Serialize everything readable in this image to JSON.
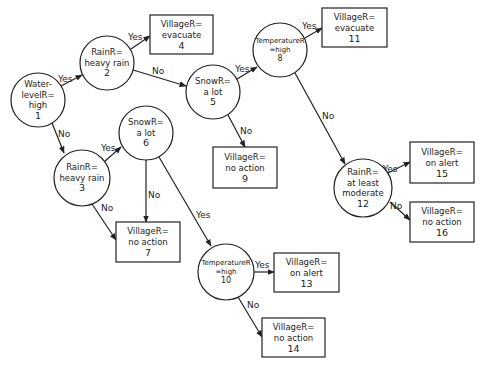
{
  "diagram": {
    "type": "decision-tree",
    "colors": {
      "stroke": "#222222",
      "background": "#ffffff"
    },
    "decision_nodes": [
      {
        "id": "1",
        "lines": [
          "Water-",
          "levelR=",
          "high",
          "1"
        ],
        "cx": 38,
        "cy": 100,
        "r": 27
      },
      {
        "id": "2",
        "lines": [
          "RainR=",
          "heavy rain",
          "2"
        ],
        "cx": 107,
        "cy": 63,
        "r": 27
      },
      {
        "id": "3",
        "lines": [
          "RainR=",
          "heavy rain",
          "3"
        ],
        "cx": 82,
        "cy": 178,
        "r": 28
      },
      {
        "id": "5",
        "lines": [
          "SnowR=",
          "a lot",
          "5"
        ],
        "cx": 213,
        "cy": 92,
        "r": 27
      },
      {
        "id": "6",
        "lines": [
          "SnowR=",
          "a lot",
          "6"
        ],
        "cx": 146,
        "cy": 133,
        "r": 27
      },
      {
        "id": "8",
        "lines": [
          "TemperatureR",
          "=high",
          "8"
        ],
        "cx": 280,
        "cy": 50,
        "r": 27
      },
      {
        "id": "10",
        "lines": [
          "TemperatureR",
          "=high",
          "10"
        ],
        "cx": 226,
        "cy": 272,
        "r": 28
      },
      {
        "id": "12",
        "lines": [
          "RainR=",
          "at least",
          "moderate",
          "12"
        ],
        "cx": 363,
        "cy": 188,
        "r": 29
      }
    ],
    "leaf_nodes": [
      {
        "id": "4",
        "lines": [
          "VillageR=",
          "evacuate",
          "4"
        ],
        "x": 150,
        "y": 15,
        "w": 63,
        "h": 39
      },
      {
        "id": "7",
        "lines": [
          "VillageR=",
          "no action",
          "7"
        ],
        "x": 116,
        "y": 222,
        "w": 64,
        "h": 40
      },
      {
        "id": "9",
        "lines": [
          "VillageR=",
          "no action",
          "9"
        ],
        "x": 213,
        "y": 147,
        "w": 64,
        "h": 41
      },
      {
        "id": "11",
        "lines": [
          "VillageR=",
          "evacuate",
          "11"
        ],
        "x": 322,
        "y": 8,
        "w": 65,
        "h": 39
      },
      {
        "id": "13",
        "lines": [
          "VillageR=",
          "on alert",
          "13"
        ],
        "x": 274,
        "y": 253,
        "w": 65,
        "h": 39
      },
      {
        "id": "14",
        "lines": [
          "VillageR=",
          "no action",
          "14"
        ],
        "x": 262,
        "y": 318,
        "w": 63,
        "h": 39
      },
      {
        "id": "15",
        "lines": [
          "VillageR=",
          "on alert",
          "15"
        ],
        "x": 410,
        "y": 142,
        "w": 64,
        "h": 41
      },
      {
        "id": "16",
        "lines": [
          "VillageR=",
          "no action",
          "16"
        ],
        "x": 410,
        "y": 202,
        "w": 64,
        "h": 40
      }
    ],
    "edges": [
      {
        "from": "1",
        "to": "2",
        "label": "Yes",
        "x1": 61,
        "y1": 86,
        "x2": 82,
        "y2": 75,
        "lx": 58,
        "ly": 82
      },
      {
        "from": "1",
        "to": "3",
        "label": "No",
        "x1": 52,
        "y1": 123,
        "x2": 64,
        "y2": 153,
        "lx": 58,
        "ly": 137
      },
      {
        "from": "2",
        "to": "4",
        "label": "Yes",
        "x1": 131,
        "y1": 49,
        "x2": 150,
        "y2": 36,
        "lx": 128,
        "ly": 40
      },
      {
        "from": "2",
        "to": "5",
        "label": "No",
        "x1": 133,
        "y1": 70,
        "x2": 186,
        "y2": 86,
        "lx": 152,
        "ly": 74
      },
      {
        "from": "3",
        "to": "6",
        "label": "Yes",
        "x1": 104,
        "y1": 162,
        "x2": 121,
        "y2": 147,
        "lx": 101,
        "ly": 151
      },
      {
        "from": "3",
        "to": "7",
        "label": "No",
        "x1": 92,
        "y1": 204,
        "x2": 116,
        "y2": 240,
        "lx": 101,
        "ly": 211
      },
      {
        "from": "5",
        "to": "8",
        "label": "Yes",
        "x1": 237,
        "y1": 79,
        "x2": 257,
        "y2": 67,
        "lx": 235,
        "ly": 72
      },
      {
        "from": "5",
        "to": "9",
        "label": "No",
        "x1": 228,
        "y1": 115,
        "x2": 245,
        "y2": 147,
        "lx": 240,
        "ly": 134
      },
      {
        "from": "6",
        "to": "7",
        "label": "No",
        "x1": 146,
        "y1": 160,
        "x2": 146,
        "y2": 222,
        "lx": 148,
        "ly": 198
      },
      {
        "from": "6",
        "to": "10",
        "label": "Yes",
        "x1": 159,
        "y1": 157,
        "x2": 211,
        "y2": 246,
        "lx": 196,
        "ly": 218
      },
      {
        "from": "8",
        "to": "11",
        "label": "Yes",
        "x1": 305,
        "y1": 38,
        "x2": 322,
        "y2": 28,
        "lx": 302,
        "ly": 29
      },
      {
        "from": "8",
        "to": "12",
        "label": "No",
        "x1": 295,
        "y1": 73,
        "x2": 345,
        "y2": 164,
        "lx": 322,
        "ly": 119
      },
      {
        "from": "10",
        "to": "13",
        "label": "Yes",
        "x1": 254,
        "y1": 272,
        "x2": 274,
        "y2": 272,
        "lx": 255,
        "ly": 268
      },
      {
        "from": "10",
        "to": "14",
        "label": "No",
        "x1": 238,
        "y1": 297,
        "x2": 262,
        "y2": 337,
        "lx": 247,
        "ly": 308
      },
      {
        "from": "12",
        "to": "15",
        "label": "Yes",
        "x1": 388,
        "y1": 173,
        "x2": 410,
        "y2": 162,
        "lx": 383,
        "ly": 172
      },
      {
        "from": "12",
        "to": "16",
        "label": "No",
        "x1": 390,
        "y1": 202,
        "x2": 410,
        "y2": 220,
        "lx": 390,
        "ly": 209
      }
    ]
  }
}
